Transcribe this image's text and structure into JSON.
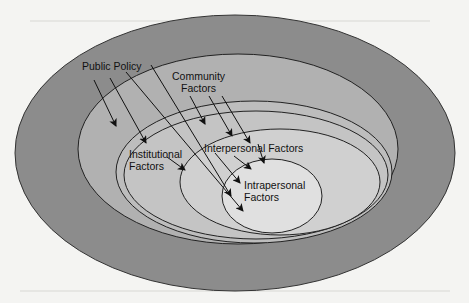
{
  "diagram": {
    "type": "nested-ellipses",
    "levels": [
      {
        "id": "public-policy",
        "label": "Public Policy",
        "fill": "#8c8c8c"
      },
      {
        "id": "community",
        "label_lines": [
          "Community",
          "Factors"
        ],
        "fill": "#b2b2b2"
      },
      {
        "id": "institutional",
        "label_lines": [
          "Institutional",
          "Factors"
        ],
        "fill": "#c6c6c6"
      },
      {
        "id": "interpersonal",
        "label": "Interpersonal Factors",
        "fill": "#d2d2d2"
      },
      {
        "id": "intrapersonal",
        "label_lines": [
          "Intrapersonal",
          "Factors"
        ],
        "fill": "#e2e2e2"
      }
    ],
    "labels": {
      "public_policy": "Public Policy",
      "community_1": "Community",
      "community_2": "Factors",
      "institutional_1": "Institutional",
      "institutional_2": "Factors",
      "interpersonal": "Interpersonal Factors",
      "intrapersonal_1": "Intrapersonal",
      "intrapersonal_2": "Factors"
    },
    "arrow_color": "#111111",
    "stroke_color": "#222222",
    "background": "#f4f4f2"
  }
}
